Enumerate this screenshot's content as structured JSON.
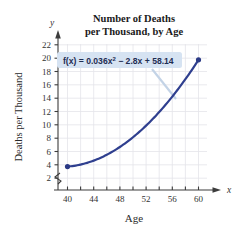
{
  "chart_data": {
    "type": "line",
    "title": "Number of Deaths per Thousand, by Age",
    "title_line1": "Number of Deaths",
    "title_line2": "per Thousand, by Age",
    "xlabel": "Age",
    "ylabel": "Deaths per Thousand",
    "x_axis_marker": "x",
    "y_axis_marker": "y",
    "xlim": [
      38,
      63
    ],
    "ylim": [
      0,
      23
    ],
    "x_ticks": [
      40,
      44,
      48,
      52,
      56,
      60
    ],
    "x_minor_ticks": [
      42,
      46,
      50,
      54,
      58,
      62
    ],
    "y_ticks": [
      2,
      4,
      6,
      8,
      10,
      12,
      14,
      16,
      18,
      20,
      22
    ],
    "grid": true,
    "axis_break": true,
    "annotation": "f(x) = 0.036x² − 2.8x + 58.14",
    "equation": {
      "lhs": "f(x) = ",
      "coef_quad": "0.036x",
      "exponent": "2",
      "rest": " − 2.8x + 58.14"
    },
    "series": [
      {
        "name": "f(x) = 0.036x² - 2.8x + 58.14",
        "x": [
          40,
          41,
          42,
          43,
          44,
          45,
          46,
          47,
          48,
          49,
          50,
          51,
          52,
          53,
          54,
          55,
          56,
          57,
          58,
          59,
          60
        ],
        "y": [
          3.74,
          3.68,
          3.68,
          3.76,
          3.9,
          4.11,
          4.4,
          4.75,
          5.18,
          5.68,
          6.24,
          6.88,
          7.59,
          8.38,
          9.23,
          10.15,
          11.15,
          12.21,
          13.35,
          14.56,
          15.84
        ]
      }
    ],
    "endpoints": [
      {
        "label": "left-endpoint",
        "x": 40,
        "y": 3.74
      },
      {
        "label": "right-endpoint",
        "x": 60,
        "y": 19.74
      }
    ],
    "colors": {
      "curve": "#2f3f8f",
      "marker": "#2b3a85",
      "grid": "#e2e2e8",
      "axis": "#444444",
      "annotation_bg": "#d6e3f2",
      "annotation_text": "#1f2d52",
      "leader_line": "#c3d3e6"
    }
  }
}
